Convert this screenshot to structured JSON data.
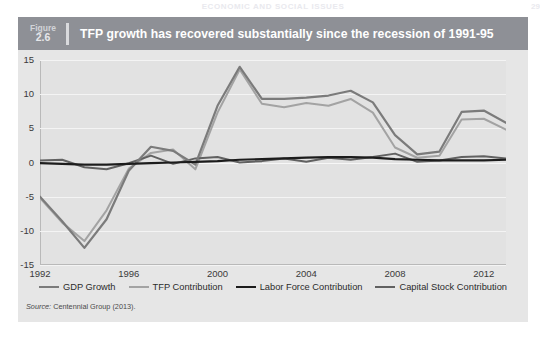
{
  "page": {
    "header_text": "ECONOMIC AND SOCIAL ISSUES",
    "page_number": "29"
  },
  "figure": {
    "label_word": "Figure",
    "number": "2.6",
    "title": "TFP growth has recovered substantially since the recession of 1991-95",
    "source_prefix": "Source:",
    "source_text": "Centennial Group (2013)."
  },
  "colors": {
    "header_bar": "#8e9096",
    "panel_bg": "#e6e6e6",
    "plot_bg": "#e2e2e2",
    "grid": "#f4f4f4",
    "gdp_growth": "#7b7b7b",
    "tfp_contribution": "#a3a3a3",
    "labor_force": "#1c1c1c",
    "capital_stock": "#616161"
  },
  "chart_data": {
    "type": "line",
    "title": "TFP growth has recovered substantially since the recession of 1991-95",
    "xlabel": "",
    "ylabel": "",
    "xlim": [
      1992,
      2013
    ],
    "ylim": [
      -15,
      15
    ],
    "yticks": [
      "15",
      "10",
      "5",
      "0",
      "-5",
      "-10",
      "-15"
    ],
    "ytick_values": [
      15,
      10,
      5,
      0,
      -5,
      -10,
      -15
    ],
    "xticks": [
      "1992",
      "1996",
      "2000",
      "2004",
      "2008",
      "2012"
    ],
    "xtick_values": [
      1992,
      1996,
      2000,
      2004,
      2008,
      2012
    ],
    "grid": true,
    "legend_position": "bottom",
    "x": [
      1992,
      1993,
      1994,
      1995,
      1996,
      1997,
      1998,
      1999,
      2000,
      2001,
      2002,
      2003,
      2004,
      2005,
      2006,
      2007,
      2008,
      2009,
      2010,
      2011,
      2012,
      2013
    ],
    "series": [
      {
        "name": "GDP Growth",
        "color": "#7b7b7b",
        "values": [
          -5.0,
          -8.6,
          -12.5,
          -8.3,
          -1.2,
          2.3,
          1.7,
          -0.3,
          8.3,
          14.0,
          9.3,
          9.3,
          9.5,
          9.8,
          10.5,
          8.8,
          4.0,
          1.2,
          1.6,
          7.4,
          7.6,
          5.8
        ]
      },
      {
        "name": "TFP Contribution",
        "color": "#a3a3a3",
        "values": [
          -5.2,
          -8.8,
          -11.5,
          -7.0,
          -0.9,
          1.4,
          1.9,
          -1.0,
          7.3,
          13.6,
          8.6,
          8.1,
          8.7,
          8.3,
          9.3,
          7.3,
          2.2,
          0.7,
          1.0,
          6.3,
          6.4,
          4.8
        ]
      },
      {
        "name": "Labor Force Contribution",
        "color": "#1c1c1c",
        "values": [
          -0.1,
          -0.2,
          -0.3,
          -0.3,
          -0.2,
          -0.1,
          0.0,
          0.1,
          0.2,
          0.4,
          0.5,
          0.6,
          0.7,
          0.8,
          0.8,
          0.7,
          0.5,
          0.4,
          0.3,
          0.3,
          0.3,
          0.4
        ]
      },
      {
        "name": "Capital Stock Contribution",
        "color": "#616161"
      }
    ]
  },
  "legend": {
    "items": [
      {
        "label": "GDP Growth",
        "color": "#7b7b7b",
        "width": "2.4"
      },
      {
        "label": "TFP Contribution",
        "color": "#a3a3a3",
        "width": "2.2"
      },
      {
        "label": "Labor Force Contribution",
        "color": "#1c1c1c",
        "width": "2.6"
      },
      {
        "label": "Capital Stock Contribution",
        "color": "#616161",
        "width": "2.2"
      }
    ]
  }
}
